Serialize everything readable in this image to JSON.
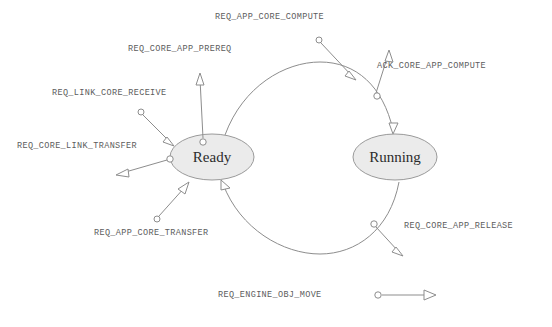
{
  "diagram": {
    "type": "state-machine",
    "colors": {
      "stroke": "#8d8d8d",
      "state_fill": "#ebebeb",
      "state_stroke": "#9a9a9a",
      "label_text": "#5c5c5c",
      "state_text": "#2b2b2b",
      "background": "#ffffff"
    },
    "states": [
      {
        "id": "ready",
        "label": "Ready",
        "cx": 212,
        "cy": 157,
        "rx": 42,
        "ry": 23
      },
      {
        "id": "running",
        "label": "Running",
        "cx": 395,
        "cy": 157,
        "rx": 42,
        "ry": 23
      }
    ],
    "transitions": [
      {
        "id": "ready-to-running",
        "from": "Ready",
        "to": "Running",
        "direction": "clockwise-top"
      },
      {
        "id": "running-to-ready",
        "from": "Running",
        "to": "Ready",
        "direction": "counterclockwise-bottom"
      }
    ],
    "signals": [
      {
        "id": "req-app-core-compute",
        "label": "REQ_APP_CORE_COMPUTE",
        "kind": "incoming",
        "attached_to": "ready-to-running"
      },
      {
        "id": "ack-core-app-compute",
        "label": "ACK_CORE_APP_COMPUTE",
        "kind": "outgoing",
        "attached_to": "ready-to-running"
      },
      {
        "id": "req-core-app-prereq",
        "label": "REQ_CORE_APP_PREREQ",
        "kind": "outgoing",
        "attached_to": "ready"
      },
      {
        "id": "req-link-core-receive",
        "label": "REQ_LINK_CORE_RECEIVE",
        "kind": "incoming",
        "attached_to": "ready"
      },
      {
        "id": "req-core-link-transfer",
        "label": "REQ_CORE_LINK_TRANSFER",
        "kind": "outgoing",
        "attached_to": "ready"
      },
      {
        "id": "req-app-core-transfer",
        "label": "REQ_APP_CORE_TRANSFER",
        "kind": "incoming",
        "attached_to": "ready"
      },
      {
        "id": "req-core-app-release",
        "label": "REQ_CORE_APP_RELEASE",
        "kind": "outgoing",
        "attached_to": "running-to-ready"
      }
    ],
    "legend": {
      "label": "REQ_ENGINE_OBJ_MOVE",
      "symbol": "signal-arrow"
    }
  }
}
